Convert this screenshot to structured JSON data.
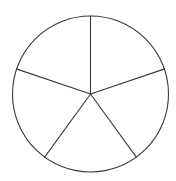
{
  "figure": {
    "background_color": "#ffffff",
    "stroke_color": "#3a3a3a",
    "fill_color": "#ffffff",
    "stroke_width": 1.1
  },
  "chart_data": {
    "type": "pie",
    "title": "",
    "xlabel": "",
    "ylabel": "",
    "legend": [],
    "grid": false,
    "labels_visible": false,
    "center": {
      "x": 90.5,
      "y": 94
    },
    "radius": 78,
    "slice_count": 5,
    "categories": [
      "Sector 1",
      "Sector 2",
      "Sector 3",
      "Sector 4",
      "Sector 5"
    ],
    "values": [
      72,
      72,
      72,
      72,
      72
    ],
    "units": "degrees",
    "start_angle_deg": 90,
    "direction": "clockwise",
    "boundary_angles_deg": [
      90,
      18,
      306,
      234,
      162
    ],
    "slices": [
      {
        "name": "Sector 1",
        "start_angle_deg": 90,
        "end_angle_deg": 18,
        "sweep_deg": 72,
        "fill": "#ffffff",
        "path": "M 90.5 94 L 90.5 16 A 78 78 0 0 1 164.70 68.89 Z"
      },
      {
        "name": "Sector 2",
        "start_angle_deg": 18,
        "end_angle_deg": 306,
        "sweep_deg": 72,
        "fill": "#ffffff",
        "path": "M 90.5 94 L 164.70 68.89 A 78 78 0 0 1 136.34 157.11 Z"
      },
      {
        "name": "Sector 3",
        "start_angle_deg": 306,
        "end_angle_deg": 234,
        "sweep_deg": 72,
        "fill": "#ffffff",
        "path": "M 90.5 94 L 136.34 157.11 A 78 78 0 0 1 44.66 157.11 Z"
      },
      {
        "name": "Sector 4",
        "start_angle_deg": 234,
        "end_angle_deg": 162,
        "sweep_deg": 72,
        "fill": "#ffffff",
        "path": "M 90.5 94 L 44.66 157.11 A 78 78 0 0 1 16.30 68.89 Z"
      },
      {
        "name": "Sector 5",
        "start_angle_deg": 162,
        "end_angle_deg": 90,
        "sweep_deg": 72,
        "fill": "#ffffff",
        "path": "M 90.5 94 L 16.30 68.89 A 78 78 0 0 1 90.5 16 Z"
      }
    ],
    "spokes": [
      {
        "name": "spoke-top",
        "angle_deg": 90,
        "x1": 90.5,
        "y1": 94,
        "x2": 90.5,
        "y2": 16
      },
      {
        "name": "spoke-upper-right",
        "angle_deg": 18,
        "x1": 90.5,
        "y1": 94,
        "x2": 164.7,
        "y2": 68.89
      },
      {
        "name": "spoke-lower-right",
        "angle_deg": 306,
        "x1": 90.5,
        "y1": 94,
        "x2": 136.34,
        "y2": 157.11
      },
      {
        "name": "spoke-lower-left",
        "angle_deg": 234,
        "x1": 90.5,
        "y1": 94,
        "x2": 44.66,
        "y2": 157.11
      },
      {
        "name": "spoke-upper-left",
        "angle_deg": 162,
        "x1": 90.5,
        "y1": 94,
        "x2": 16.3,
        "y2": 68.89
      }
    ]
  }
}
